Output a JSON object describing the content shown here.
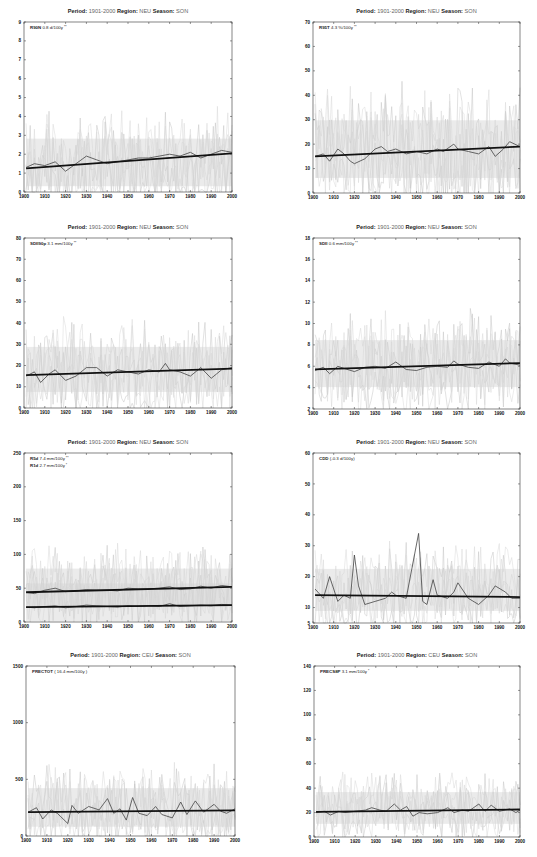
{
  "figure": {
    "title_labels": {
      "period": "Period:",
      "region": "Region:",
      "season": "Season:"
    }
  },
  "chart_data": [
    {
      "type": "line",
      "id": "p1",
      "title": {
        "period": "1901-2000",
        "region": "NEU",
        "season": "SON"
      },
      "annotations": [
        {
          "index": "R90N",
          "text": "0.8 d/100y",
          "sig": "**"
        }
      ],
      "xlim": [
        1900,
        2000
      ],
      "xticks": [
        1900,
        1910,
        1920,
        1930,
        1940,
        1950,
        1960,
        1970,
        1980,
        1990,
        2000
      ],
      "ylim": [
        0,
        9
      ],
      "yticks": [
        0,
        1,
        2,
        3,
        4,
        5,
        6,
        7,
        8,
        9
      ],
      "trend": [
        {
          "x0": 1901,
          "y0": 1.25,
          "x1": 2000,
          "y1": 2.05
        }
      ],
      "smoothed": [
        {
          "x": [
            1901,
            1905,
            1910,
            1915,
            1920,
            1925,
            1930,
            1935,
            1940,
            1945,
            1950,
            1955,
            1960,
            1965,
            1970,
            1975,
            1980,
            1985,
            1990,
            1995,
            2000
          ],
          "y": [
            1.3,
            1.5,
            1.4,
            1.6,
            1.1,
            1.5,
            1.9,
            1.7,
            1.5,
            1.6,
            1.7,
            1.8,
            1.8,
            1.9,
            2.0,
            1.9,
            2.1,
            1.8,
            2.0,
            2.2,
            2.1
          ]
        }
      ],
      "noise_range": [
        0.2,
        6.5
      ],
      "grid": false
    },
    {
      "type": "line",
      "id": "p2",
      "title": {
        "period": "1901-2000",
        "region": "NEU",
        "season": "SON"
      },
      "annotations": [
        {
          "index": "R95T",
          "text": "4.3 %/100y",
          "sig": "**"
        }
      ],
      "xlim": [
        1900,
        2000
      ],
      "xticks": [
        1900,
        1910,
        1920,
        1930,
        1940,
        1950,
        1960,
        1970,
        1980,
        1990,
        2000
      ],
      "ylim": [
        0,
        70
      ],
      "yticks": [
        0,
        10,
        20,
        30,
        40,
        50,
        60,
        70
      ],
      "trend": [
        {
          "x0": 1901,
          "y0": 15,
          "x1": 2000,
          "y1": 19
        }
      ],
      "smoothed": [
        {
          "x": [
            1901,
            1905,
            1908,
            1912,
            1915,
            1918,
            1920,
            1925,
            1930,
            1933,
            1936,
            1940,
            1945,
            1950,
            1955,
            1960,
            1963,
            1968,
            1970,
            1975,
            1980,
            1985,
            1988,
            1992,
            1995,
            2000
          ],
          "y": [
            15,
            16,
            13,
            18,
            16,
            13,
            12,
            14,
            18,
            19,
            17,
            18,
            16,
            17,
            16,
            18,
            17,
            20,
            18,
            17,
            16,
            19,
            15,
            18,
            21,
            19
          ]
        }
      ],
      "noise_range": [
        1,
        60
      ],
      "grid": false
    },
    {
      "type": "line",
      "id": "p3",
      "title": {
        "period": "1901-2000",
        "region": "NEU",
        "season": "SON"
      },
      "annotations": [
        {
          "index": "SDII90p",
          "text": "3.1 mm/100y",
          "sig": "**"
        }
      ],
      "xlim": [
        1900,
        2000
      ],
      "xticks": [
        1900,
        1910,
        1920,
        1930,
        1940,
        1950,
        1960,
        1970,
        1980,
        1990,
        2000
      ],
      "ylim": [
        0,
        80
      ],
      "yticks": [
        0,
        10,
        20,
        30,
        40,
        50,
        60,
        70,
        80
      ],
      "trend": [
        {
          "x0": 1901,
          "y0": 15.5,
          "x1": 2000,
          "y1": 18.5
        }
      ],
      "smoothed": [
        {
          "x": [
            1901,
            1905,
            1908,
            1912,
            1915,
            1920,
            1925,
            1930,
            1935,
            1940,
            1945,
            1950,
            1955,
            1960,
            1965,
            1968,
            1970,
            1975,
            1980,
            1985,
            1990,
            1995,
            2000
          ],
          "y": [
            15,
            17,
            12,
            16,
            18,
            13,
            15,
            19,
            19,
            15,
            18,
            17,
            16,
            18,
            17,
            21,
            18,
            17,
            15,
            19,
            14,
            18,
            19
          ]
        }
      ],
      "noise_range": [
        2,
        55
      ],
      "grid": false
    },
    {
      "type": "line",
      "id": "p4",
      "title": {
        "period": "1901-2000",
        "region": "NEU",
        "season": "SON"
      },
      "annotations": [
        {
          "index": "SDII",
          "text": "0.6 mm/100y",
          "sig": "**"
        }
      ],
      "xlim": [
        1900,
        2000
      ],
      "xticks": [
        1900,
        1910,
        1920,
        1930,
        1940,
        1950,
        1960,
        1970,
        1980,
        1990,
        2000
      ],
      "ylim": [
        2,
        18
      ],
      "yticks": [
        2,
        4,
        6,
        8,
        10,
        12,
        14,
        16,
        18
      ],
      "trend": [
        {
          "x0": 1901,
          "y0": 5.7,
          "x1": 2000,
          "y1": 6.3
        }
      ],
      "smoothed": [
        {
          "x": [
            1901,
            1905,
            1908,
            1912,
            1915,
            1920,
            1925,
            1930,
            1935,
            1940,
            1945,
            1950,
            1955,
            1960,
            1965,
            1968,
            1970,
            1975,
            1980,
            1985,
            1990,
            1993,
            1995,
            2000
          ],
          "y": [
            5.6,
            5.9,
            5.3,
            6.0,
            5.8,
            5.5,
            5.9,
            6.0,
            5.8,
            6.4,
            5.7,
            5.6,
            5.9,
            6.0,
            5.9,
            6.5,
            6.2,
            5.9,
            5.8,
            6.4,
            6.0,
            6.7,
            6.3,
            6.1
          ]
        }
      ],
      "noise_range": [
        3,
        14
      ],
      "grid": false
    },
    {
      "type": "line",
      "id": "p5",
      "title": {
        "period": "1901-2000",
        "region": "NEU",
        "season": "SON"
      },
      "annotations": [
        {
          "index": "R5d",
          "text": "7.4 mm/100y",
          "sig": "**"
        },
        {
          "index": "R1d",
          "text": "2.7 mm/100y",
          "sig": "*"
        }
      ],
      "xlim": [
        1900,
        2000
      ],
      "xticks": [
        1900,
        1910,
        1920,
        1930,
        1940,
        1950,
        1960,
        1970,
        1980,
        1990,
        2000
      ],
      "ylim": [
        0,
        250
      ],
      "yticks": [
        0,
        50,
        100,
        150,
        200,
        250
      ],
      "trend": [
        {
          "x0": 1901,
          "y0": 44,
          "x1": 2000,
          "y1": 52
        },
        {
          "x0": 1901,
          "y0": 22,
          "x1": 2000,
          "y1": 25
        }
      ],
      "smoothed": [
        {
          "x": [
            1901,
            1905,
            1910,
            1915,
            1920,
            1925,
            1930,
            1935,
            1940,
            1945,
            1950,
            1955,
            1960,
            1965,
            1970,
            1975,
            1980,
            1985,
            1990,
            1995,
            2000
          ],
          "y": [
            44,
            42,
            47,
            50,
            45,
            46,
            48,
            47,
            47,
            46,
            50,
            49,
            49,
            50,
            52,
            48,
            49,
            53,
            50,
            54,
            52
          ]
        },
        {
          "x": [
            1901,
            1905,
            1910,
            1915,
            1920,
            1925,
            1930,
            1935,
            1940,
            1945,
            1950,
            1955,
            1960,
            1965,
            1970,
            1975,
            1980,
            1985,
            1990,
            1995,
            2000
          ],
          "y": [
            22,
            21,
            23,
            24,
            21,
            23,
            25,
            24,
            23,
            22,
            24,
            23,
            24,
            23,
            27,
            23,
            24,
            25,
            24,
            26,
            25
          ]
        }
      ],
      "noise_range": [
        10,
        150
      ],
      "grid": false
    },
    {
      "type": "line",
      "id": "p6",
      "title": {
        "period": "1901-2000",
        "region": "NEU",
        "season": "SON"
      },
      "annotations": [
        {
          "index": "CDD",
          "text": "(-0.3 d/100y)",
          "sig": ""
        }
      ],
      "xlim": [
        1900,
        2000
      ],
      "xticks": [
        1900,
        1910,
        1920,
        1930,
        1940,
        1950,
        1960,
        1970,
        1980,
        1990,
        2000
      ],
      "ylim": [
        5,
        60
      ],
      "yticks": [
        5,
        10,
        20,
        30,
        40,
        50,
        60
      ],
      "trend": [
        {
          "x0": 1901,
          "y0": 14,
          "x1": 2000,
          "y1": 13.4
        }
      ],
      "smoothed": [
        {
          "x": [
            1901,
            1905,
            1908,
            1912,
            1915,
            1918,
            1920,
            1922,
            1925,
            1930,
            1935,
            1938,
            1940,
            1945,
            1951,
            1953,
            1955,
            1958,
            1960,
            1965,
            1968,
            1970,
            1975,
            1980,
            1985,
            1988,
            1993,
            1996,
            2000
          ],
          "y": [
            16,
            13,
            20,
            12,
            14,
            13,
            27,
            17,
            11,
            12,
            13,
            15,
            14,
            13,
            34,
            12,
            11,
            19,
            14,
            13,
            15,
            18,
            13,
            11,
            14,
            17,
            15,
            13,
            13
          ]
        }
      ],
      "noise_range": [
        6,
        40
      ],
      "grid": false
    },
    {
      "type": "line",
      "id": "p7",
      "title": {
        "period": "1901-2000",
        "region": "CEU",
        "season": "SON"
      },
      "annotations": [
        {
          "index": "PRECTOT",
          "text": "( 16.4 mm/100y )",
          "sig": ""
        }
      ],
      "xlim": [
        1900,
        2000
      ],
      "xticks": [
        1900,
        1910,
        1920,
        1930,
        1940,
        1950,
        1960,
        1970,
        1980,
        1990,
        2000
      ],
      "ylim": [
        0,
        1500
      ],
      "yticks": [
        0,
        500,
        1000,
        1500
      ],
      "trend": [
        {
          "x0": 1901,
          "y0": 210,
          "x1": 2000,
          "y1": 226
        }
      ],
      "smoothed": [
        {
          "x": [
            1901,
            1905,
            1908,
            1912,
            1915,
            1920,
            1922,
            1925,
            1930,
            1935,
            1939,
            1942,
            1945,
            1948,
            1951,
            1954,
            1958,
            1962,
            1965,
            1970,
            1974,
            1977,
            1981,
            1985,
            1990,
            1993,
            1996,
            2000
          ],
          "y": [
            210,
            250,
            150,
            230,
            200,
            110,
            270,
            200,
            260,
            230,
            330,
            200,
            240,
            140,
            340,
            200,
            180,
            260,
            190,
            160,
            300,
            190,
            310,
            210,
            280,
            220,
            200,
            240
          ]
        }
      ],
      "noise_range": [
        50,
        900
      ],
      "grid": false
    },
    {
      "type": "line",
      "id": "p8",
      "title": {
        "period": "1901-2000",
        "region": "CEU",
        "season": "SON"
      },
      "annotations": [
        {
          "index": "PRECS8P",
          "text": "3.1 mm/100y",
          "sig": "*"
        }
      ],
      "xlim": [
        1900,
        2000
      ],
      "xticks": [
        1900,
        1910,
        1920,
        1930,
        1940,
        1950,
        1960,
        1970,
        1980,
        1990,
        2000
      ],
      "ylim": [
        0,
        140
      ],
      "yticks": [
        0,
        20,
        40,
        60,
        80,
        100,
        120,
        140
      ],
      "trend": [
        {
          "x0": 1901,
          "y0": 20.5,
          "x1": 2000,
          "y1": 22.5
        }
      ],
      "smoothed": [
        {
          "x": [
            1901,
            1905,
            1908,
            1912,
            1915,
            1920,
            1925,
            1928,
            1932,
            1935,
            1939,
            1942,
            1945,
            1948,
            1951,
            1955,
            1960,
            1965,
            1968,
            1972,
            1975,
            1980,
            1983,
            1986,
            1990,
            1995,
            1998,
            2000
          ],
          "y": [
            20,
            21,
            18,
            21,
            20,
            21,
            22,
            24,
            22,
            21,
            27,
            22,
            25,
            17,
            20,
            19,
            20,
            24,
            20,
            22,
            21,
            27,
            21,
            26,
            21,
            23,
            20,
            22
          ]
        }
      ],
      "noise_range": [
        5,
        70
      ],
      "grid": false
    }
  ]
}
